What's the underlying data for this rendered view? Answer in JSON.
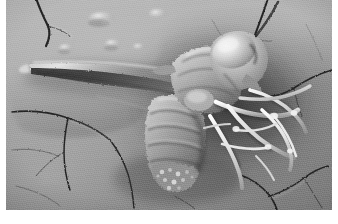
{
  "figure": {
    "caption": "",
    "kind": "sem-micrograph",
    "colors": {
      "frame": "#ffffff",
      "substrate_light": "#bcbcbc",
      "substrate_mid": "#9e9e9e",
      "substrate_dark": "#7d7d7d",
      "shadow": "#2b2b2b",
      "specimen_highlight": "#efefef",
      "specimen_mid": "#a8a8a8",
      "specimen_dark": "#454545",
      "crack": "#1d1d1d"
    },
    "plate": {
      "x": 6,
      "y": 0,
      "width": 326,
      "height": 210
    }
  },
  "subject": {
    "name": "insect-specimen",
    "description": "Dead winged insect lying on its side",
    "parts": [
      {
        "id": "head",
        "label": "head"
      },
      {
        "id": "compound-eye",
        "label": "compound eye"
      },
      {
        "id": "thorax",
        "label": "thorax"
      },
      {
        "id": "abdomen",
        "label": "segmented abdomen"
      },
      {
        "id": "wing",
        "label": "folded wing"
      },
      {
        "id": "legs",
        "label": "tangled legs"
      },
      {
        "id": "antenna",
        "label": "antenna"
      }
    ]
  },
  "background": {
    "name": "cracked-substrate",
    "description": "Dried, cracked mud-like surface with blistered bumps",
    "features": [
      {
        "id": "crack-upper-left",
        "label": "crack"
      },
      {
        "id": "crack-upper-right",
        "label": "crack"
      },
      {
        "id": "crack-lower-left",
        "label": "crack"
      },
      {
        "id": "crack-lower-right",
        "label": "crack"
      },
      {
        "id": "crack-center",
        "label": "crack"
      },
      {
        "id": "blister-bumps",
        "label": "surface blisters"
      },
      {
        "id": "flake-edge",
        "label": "lifted flake edge"
      }
    ]
  }
}
